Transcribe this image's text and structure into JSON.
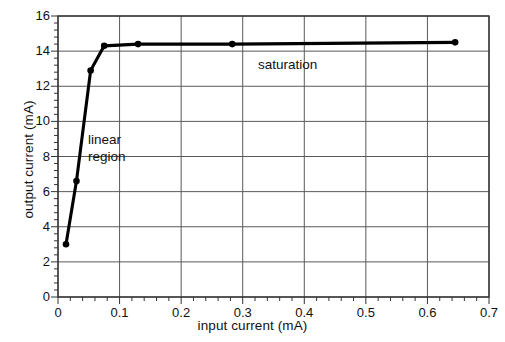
{
  "chart_data": {
    "type": "line",
    "title": "",
    "xlabel": "input current (mA)",
    "ylabel": "output current (mA)",
    "xlim": [
      0,
      0.7
    ],
    "ylim": [
      0,
      16
    ],
    "xticks": [
      "0",
      "0.1",
      "0.2",
      "0.3",
      "0.4",
      "0.5",
      "0.6",
      "0.7"
    ],
    "xtick_values": [
      0,
      0.1,
      0.2,
      0.3,
      0.4,
      0.5,
      0.6,
      0.7
    ],
    "yticks": [
      "0",
      "2",
      "4",
      "6",
      "8",
      "10",
      "12",
      "14",
      "16"
    ],
    "ytick_values": [
      0,
      2,
      4,
      6,
      8,
      10,
      12,
      14,
      16
    ],
    "grid": true,
    "minor_ticks": true,
    "legend": null,
    "series": [
      {
        "name": "transfer characteristic",
        "color": "#000000",
        "marker": "filled-circle",
        "x": [
          0.013,
          0.03,
          0.053,
          0.075,
          0.13,
          0.283,
          0.645
        ],
        "y": [
          3.0,
          6.6,
          12.9,
          14.3,
          14.4,
          14.4,
          14.5
        ]
      }
    ],
    "annotations": [
      {
        "name": "linear-region",
        "text_lines": [
          "linear",
          "region"
        ],
        "x": 0.06,
        "y": 8.7
      },
      {
        "name": "saturation",
        "text_lines": [
          "saturation"
        ],
        "x": 0.325,
        "y": 13.0
      }
    ]
  },
  "colors": {
    "curve": "#000000",
    "grid": "#595959",
    "axis": "#333333",
    "background": "#ffffff",
    "text": "#111111"
  }
}
